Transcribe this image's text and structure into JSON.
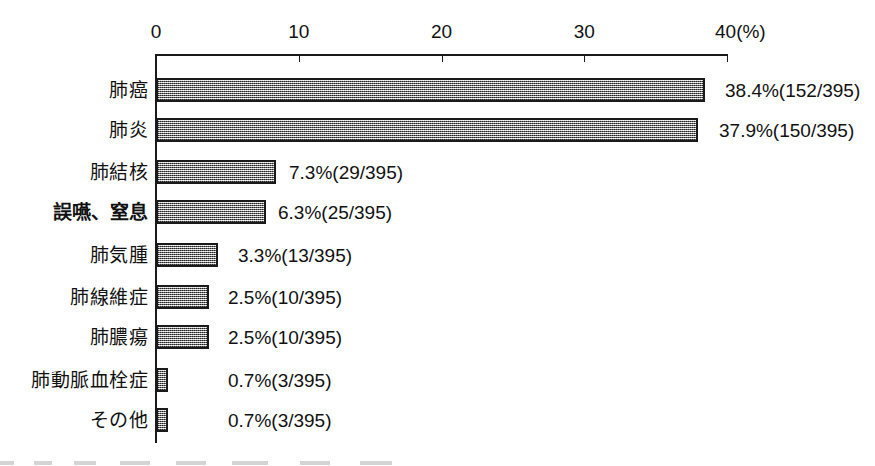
{
  "chart_data": {
    "type": "bar",
    "orientation": "horizontal",
    "title": "",
    "subtitle": "",
    "xlabel": "",
    "ylabel": "",
    "unit_label": "(%)",
    "xlim": [
      0,
      40
    ],
    "grid": false,
    "legend": null,
    "denominator": 395,
    "axis": {
      "ticks": [
        {
          "value": 0,
          "label": "0"
        },
        {
          "value": 10,
          "label": "10"
        },
        {
          "value": 20,
          "label": "20"
        },
        {
          "value": 30,
          "label": "30"
        },
        {
          "value": 40,
          "label": "40"
        }
      ],
      "unit_suffix": "(%)"
    },
    "categories": [
      "肺癌",
      "肺炎",
      "肺結核",
      "誤嚥、窒息",
      "肺気腫",
      "肺線維症",
      "肺膿瘍",
      "肺動脈血栓症",
      "その他"
    ],
    "values": [
      38.4,
      37.9,
      7.3,
      6.3,
      3.3,
      2.5,
      2.5,
      0.7,
      0.7
    ],
    "counts": [
      152,
      150,
      29,
      25,
      13,
      10,
      10,
      3,
      3
    ],
    "data_labels": [
      "38.4%(152/395)",
      "37.9%(150/395)",
      "7.3%(29/395)",
      "6.3%(25/395)",
      "3.3%(13/395)",
      "2.5%(10/395)",
      "2.5%(10/395)",
      "0.7%(3/395)",
      "0.7%(3/395)"
    ]
  },
  "rows": [
    {
      "label": "肺癌",
      "value": 38.4,
      "count": 152,
      "total": 395,
      "data_label": "38.4%(152/395)",
      "bold_label": false,
      "bar_px": 549,
      "label_x": 725,
      "y": 78
    },
    {
      "label": "肺炎",
      "value": 37.9,
      "count": 150,
      "total": 395,
      "data_label": "37.9%(150/395)",
      "bold_label": false,
      "bar_px": 542,
      "label_x": 719,
      "y": 118
    },
    {
      "label": "肺結核",
      "value": 7.3,
      "count": 29,
      "total": 395,
      "data_label": "7.3%(29/395)",
      "bold_label": false,
      "bar_px": 120,
      "label_x": 289,
      "y": 160
    },
    {
      "label": "誤嚥、窒息",
      "value": 6.3,
      "count": 25,
      "total": 395,
      "data_label": "6.3%(25/395)",
      "bold_label": true,
      "bar_px": 110,
      "label_x": 278,
      "y": 200
    },
    {
      "label": "肺気腫",
      "value": 3.3,
      "count": 13,
      "total": 395,
      "data_label": "3.3%(13/395)",
      "bold_label": false,
      "bar_px": 62,
      "label_x": 238,
      "y": 243
    },
    {
      "label": "肺線維症",
      "value": 2.5,
      "count": 10,
      "total": 395,
      "data_label": "2.5%(10/395)",
      "bold_label": false,
      "bar_px": 53,
      "label_x": 228,
      "y": 285
    },
    {
      "label": "肺膿瘍",
      "value": 2.5,
      "count": 10,
      "total": 395,
      "data_label": "2.5%(10/395)",
      "bold_label": false,
      "bar_px": 53,
      "label_x": 228,
      "y": 325
    },
    {
      "label": "肺動脈血栓症",
      "value": 0.7,
      "count": 3,
      "total": 395,
      "data_label": "0.7%(3/395)",
      "bold_label": false,
      "bar_px": 12,
      "label_x": 228,
      "y": 368
    },
    {
      "label": "その他",
      "value": 0.7,
      "count": 3,
      "total": 395,
      "data_label": "0.7%(3/395)",
      "bold_label": false,
      "bar_px": 12,
      "label_x": 228,
      "y": 408
    }
  ],
  "style": {
    "bar_fill": "#a8a8a8",
    "bar_border": "#1a1a1a",
    "axis_color": "#1a1a1a",
    "text_color": "#111111",
    "background": "#ffffff"
  }
}
